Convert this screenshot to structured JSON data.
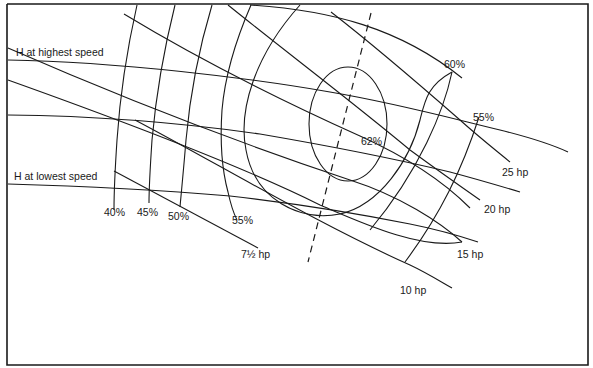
{
  "diagram": {
    "type": "fan performance map",
    "head_curves": {
      "highest_speed_label": "H at highest speed",
      "lowest_speed_label": "H at lowest speed"
    },
    "efficiency_labels": {
      "e40": "40%",
      "e45": "45%",
      "e50": "50%",
      "e55_left": "55%",
      "e55_right": "55%",
      "e60": "60%",
      "e62": "62%"
    },
    "power_labels": {
      "p7_5": "7½ hp",
      "p10": "10 hp",
      "p15": "15 hp",
      "p20": "20 hp",
      "p25": "25 hp"
    },
    "colors": {
      "line": "#1a1a1a",
      "background": "#ffffff"
    }
  }
}
